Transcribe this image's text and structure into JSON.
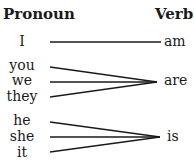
{
  "headers": {
    "pronoun": "Pronoun",
    "verb": "Verb"
  },
  "groups": [
    {
      "pronouns": [
        "I"
      ],
      "verb": "am"
    },
    {
      "pronouns": [
        "you",
        "we",
        "they"
      ],
      "verb": "are"
    },
    {
      "pronouns": [
        "he",
        "she",
        "it"
      ],
      "verb": "is"
    }
  ],
  "colors": {
    "line": "#1a1a1a",
    "text": "#1a1a1a"
  }
}
